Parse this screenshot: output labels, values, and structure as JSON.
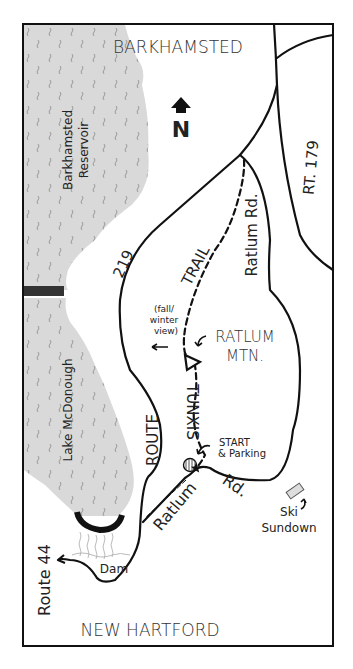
{
  "map": {
    "colors": {
      "water": "#d9d9d9",
      "ink": "#111111",
      "background": "#ffffff"
    },
    "compass": {
      "label": "N",
      "icon": "north-arrow-icon"
    },
    "towns": {
      "north": "BARKHAMSTED",
      "south": "NEW HARTFORD"
    },
    "water": {
      "reservoir": "Barkhamsted Reservoir",
      "reservoir_line1": "Barkhamsted",
      "reservoir_line2": "Reservoir",
      "lake": "Lake McDonough",
      "dam": "Dam"
    },
    "roads": {
      "route_219_number": "219",
      "route_219_word": "ROUTE",
      "rt_179": "RT. 179",
      "ratlum_rd_north": "Ratlum Rd.",
      "ratlum_rd_south_1": "Ratlum",
      "ratlum_rd_south_2": "Rd.",
      "route_44": "Route 44"
    },
    "trail": {
      "name_1": "TUNXIS",
      "name_2": "TRAIL"
    },
    "landmarks": {
      "mountain_1": "RATLUM",
      "mountain_2": "MTN.",
      "view_1": "(fall/",
      "view_2": "winter",
      "view_3": "view)",
      "start_1": "START",
      "start_2": "& Parking",
      "ski_1": "Ski",
      "ski_2": "Sundown"
    }
  }
}
